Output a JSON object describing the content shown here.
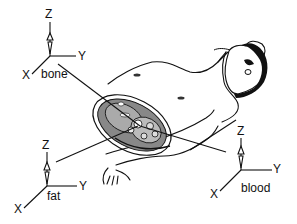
{
  "figure": {
    "frames": [
      {
        "id": "bone",
        "label": "bone",
        "axes": {
          "x": "X",
          "y": "Y",
          "z": "Z"
        }
      },
      {
        "id": "fat",
        "label": "fat",
        "axes": {
          "x": "X",
          "y": "Y",
          "z": "Z"
        }
      },
      {
        "id": "blood",
        "label": "blood",
        "axes": {
          "x": "X",
          "y": "Y",
          "z": "Z"
        }
      }
    ],
    "colors": {
      "ink": "#111111",
      "background": "#ffffff"
    }
  }
}
